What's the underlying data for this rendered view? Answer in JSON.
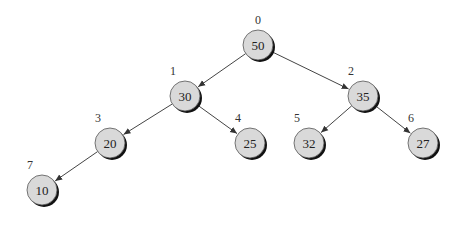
{
  "diagram": {
    "type": "binary-heap-tree",
    "node_fill": "#d9d9d9",
    "nodes": [
      {
        "index": "0",
        "value": "50",
        "x": 258,
        "y": 45
      },
      {
        "index": "1",
        "value": "30",
        "x": 185,
        "y": 96
      },
      {
        "index": "2",
        "value": "35",
        "x": 363,
        "y": 96
      },
      {
        "index": "3",
        "value": "20",
        "x": 110,
        "y": 143
      },
      {
        "index": "4",
        "value": "25",
        "x": 250,
        "y": 143
      },
      {
        "index": "5",
        "value": "32",
        "x": 309,
        "y": 143
      },
      {
        "index": "6",
        "value": "27",
        "x": 423,
        "y": 143
      },
      {
        "index": "7",
        "value": "10",
        "x": 42,
        "y": 190
      }
    ],
    "edges": [
      [
        0,
        1
      ],
      [
        0,
        2
      ],
      [
        1,
        3
      ],
      [
        1,
        4
      ],
      [
        2,
        5
      ],
      [
        2,
        6
      ],
      [
        3,
        7
      ]
    ]
  }
}
